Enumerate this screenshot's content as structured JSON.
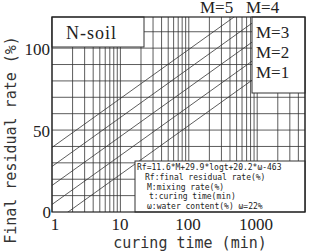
{
  "chart_data": {
    "type": "line",
    "title": "N-soil",
    "xlabel": "curing time (min)",
    "ylabel": "Final residual rate (%)",
    "xscale": "log",
    "xlim": [
      1,
      5000
    ],
    "ylim": [
      0,
      119
    ],
    "grid": true,
    "x_ticks": [
      {
        "value": 1,
        "label": "1"
      },
      {
        "value": 10,
        "label": "10"
      },
      {
        "value": 100,
        "label": "100"
      },
      {
        "value": 1000,
        "label": "1000"
      }
    ],
    "y_ticks": [
      {
        "value": 0,
        "label": "0"
      },
      {
        "value": 50,
        "label": "50"
      },
      {
        "value": 100,
        "label": "100"
      }
    ],
    "y_grid_step": 10,
    "formula": {
      "intercept_terms": {
        "M_coef": 11.6,
        "logt_coef": 29.9,
        "omega_coef": 20.2,
        "const": -463,
        "omega": 22
      }
    },
    "series": [
      {
        "name": "M=1",
        "M": 1
      },
      {
        "name": "M=2",
        "M": 2
      },
      {
        "name": "M=3",
        "M": 3
      },
      {
        "name": "M=4",
        "M": 4
      },
      {
        "name": "M=5",
        "M": 5
      }
    ],
    "legend_box": [
      "M=3",
      "M=2",
      "M=1"
    ],
    "top_labels": [
      "M=5",
      "M=4"
    ],
    "annotation_lines": [
      "Rf=11.6*M+29.9*logt+20.2*ω-463",
      "Rf:final residual rate(%)",
      "M:mixing rate(%)",
      "t:curing time(min)",
      "ω:water content(%) ω=22%"
    ]
  }
}
